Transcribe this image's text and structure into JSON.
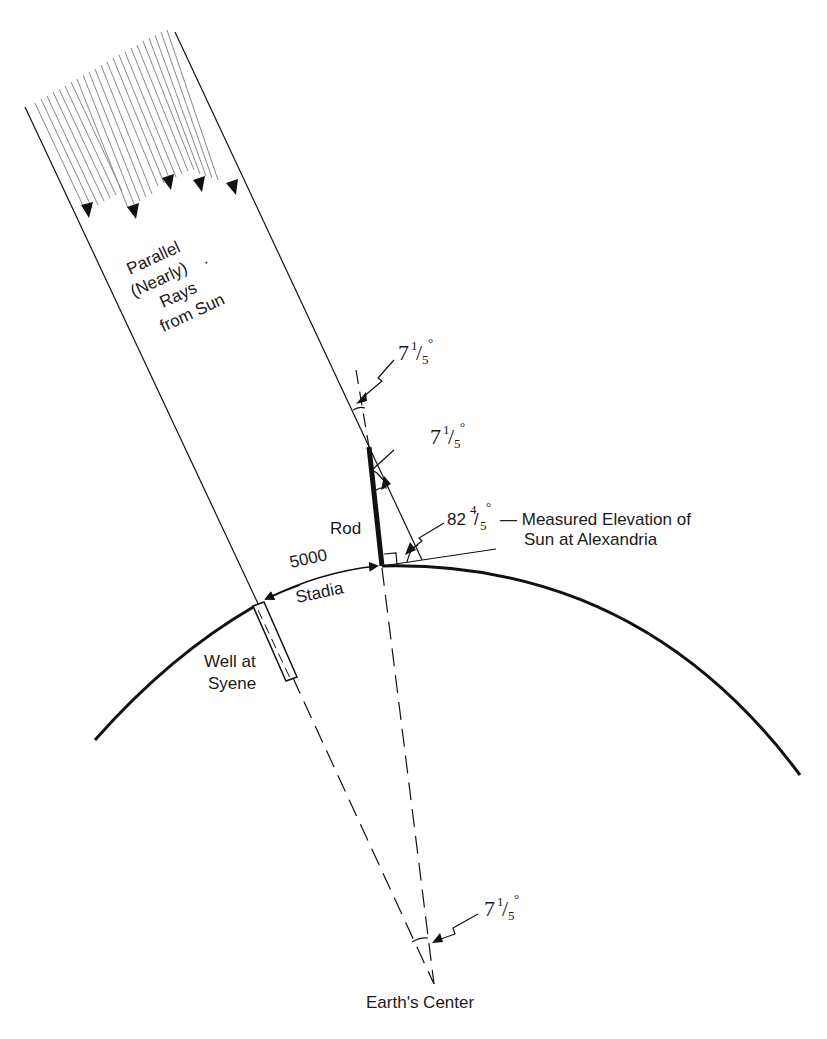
{
  "diagram": {
    "labels": {
      "sun_rays": [
        "Parallel",
        "(Nearly)",
        "Rays",
        "from Sun"
      ],
      "sun_rays_dot": ".",
      "rod": "Rod",
      "distance_value": "5000",
      "distance_unit": "Stadia",
      "well": [
        "Well at",
        "Syene"
      ],
      "elevation_angle_whole": "82",
      "elevation_angle_num": "4",
      "elevation_angle_den": "5",
      "elevation_caption": [
        "— Measured Elevation of",
        "Sun at Alexandria"
      ],
      "center": "Earth's Center"
    },
    "angles": [
      {
        "id": "angle-top",
        "whole": "7",
        "num": "1",
        "den": "5",
        "deg": "°"
      },
      {
        "id": "angle-rod",
        "whole": "7",
        "num": "1",
        "den": "5",
        "deg": "°"
      },
      {
        "id": "angle-center",
        "whole": "7",
        "num": "1",
        "den": "5",
        "deg": "°"
      }
    ],
    "elevation_deg_symbol": "°",
    "fraction_slash": "/",
    "colors": {
      "line": "#111111",
      "ray": "#777777",
      "background": "#ffffff"
    }
  }
}
